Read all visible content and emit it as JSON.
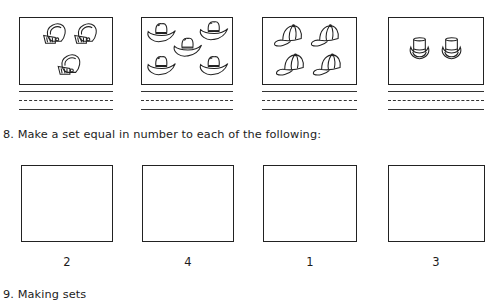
{
  "exercise_7": {
    "picture_sets": [
      {
        "item": "football-helmet",
        "count": 3,
        "answer": ""
      },
      {
        "item": "cowboy-hat",
        "count": 5,
        "answer": ""
      },
      {
        "item": "baseball-cap",
        "count": 4,
        "answer": ""
      },
      {
        "item": "top-hat",
        "count": 2,
        "answer": ""
      }
    ]
  },
  "exercise_8": {
    "instruction": "8.  Make a set equal in number to each of the following:",
    "boxes": [
      {
        "label": "2"
      },
      {
        "label": "4"
      },
      {
        "label": "1"
      },
      {
        "label": "3"
      }
    ]
  },
  "exercise_9": {
    "title": "9.  Making sets"
  },
  "colors": {
    "ink": "#222222",
    "paper": "#ffffff"
  }
}
